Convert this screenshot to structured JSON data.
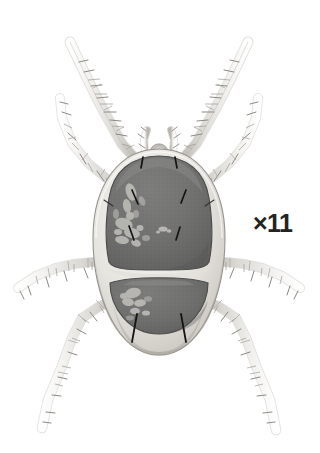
{
  "figure": {
    "kind": "scientific-illustration",
    "subject_label": "mite-dorsal-view",
    "background_color": "#ffffff",
    "magnification": {
      "text": "×11",
      "color": "#232323",
      "x": 253,
      "y": 211
    },
    "palette": {
      "background": "#ffffff",
      "body_margin_light": "#eceae5",
      "body_margin_mid": "#d6d3cd",
      "body_shadow": "#b4b1ab",
      "shield_dark": "#6f6f6f",
      "shield_dark_edge": "#5a5a5a",
      "shield_highlight": "#a8a8a6",
      "leg_light": "#f1f0ee",
      "leg_mid": "#d2d0cb",
      "leg_outline": "#8f8d88",
      "seta_black": "#1a1a1a",
      "outline": "#9a9790"
    },
    "body": {
      "name": "idiosoma",
      "center_x": 159,
      "center_y": 252,
      "width": 132,
      "height": 206,
      "top": 149,
      "bottom": 355
    },
    "anterior_shield": {
      "name": "prodorsal-shield",
      "top": 156,
      "bottom": 268,
      "left": 106,
      "right": 212
    },
    "posterior_shield": {
      "name": "opisthosomal-shield",
      "top": 276,
      "bottom": 334,
      "left": 110,
      "right": 208
    },
    "gnathosoma": {
      "name": "gnathosoma-capitulum",
      "x": 159,
      "y": 146
    },
    "palps": [
      {
        "name": "palp-left",
        "x": 146,
        "y": 134
      },
      {
        "name": "palp-right",
        "x": 172,
        "y": 134
      }
    ],
    "legs": [
      {
        "name": "leg-I-left",
        "side": "left",
        "index": 1,
        "direction": "anterior-dorsal"
      },
      {
        "name": "leg-II-left",
        "side": "left",
        "index": 2,
        "direction": "anterior-lateral"
      },
      {
        "name": "leg-III-left",
        "side": "left",
        "index": 3,
        "direction": "posterior-lateral"
      },
      {
        "name": "leg-IV-left",
        "side": "left",
        "index": 4,
        "direction": "posterior"
      },
      {
        "name": "leg-I-right",
        "side": "right",
        "index": 1,
        "direction": "anterior-dorsal"
      },
      {
        "name": "leg-II-right",
        "side": "right",
        "index": 2,
        "direction": "anterior-lateral"
      },
      {
        "name": "leg-III-right",
        "side": "right",
        "index": 3,
        "direction": "posterior-lateral"
      },
      {
        "name": "leg-IV-right",
        "side": "right",
        "index": 4,
        "direction": "posterior"
      }
    ],
    "setae_count": 10
  }
}
